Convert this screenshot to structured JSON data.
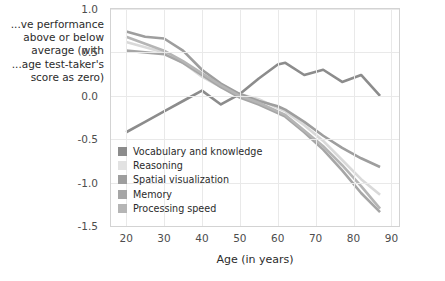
{
  "chart_data": {
    "type": "line",
    "title": "",
    "xlabel": "Age (in years)",
    "ylabel": "...ve performance\nabove or below\naverage (with\n...age test-taker's\nscore as zero)",
    "xlim": [
      16,
      92
    ],
    "ylim": [
      -1.5,
      1.0
    ],
    "xticks": [
      "20",
      "30",
      "40",
      "50",
      "60",
      "70",
      "80",
      "90"
    ],
    "xtick_values": [
      20,
      30,
      40,
      50,
      60,
      70,
      80,
      90
    ],
    "yticks": [
      "1.0",
      "0.5",
      "0.0",
      "-0.5",
      "-1.0",
      "-1.5"
    ],
    "ytick_values": [
      1.0,
      0.5,
      0.0,
      -0.5,
      -1.0,
      -1.5
    ],
    "grid": true,
    "legend_position": "center-left-inside",
    "x": [
      20,
      25,
      30,
      35,
      40,
      45,
      50,
      55,
      60,
      62,
      67,
      72,
      77,
      82,
      87
    ],
    "series": [
      {
        "name": "Vocabulary and knowledge",
        "color": "#8c8c8c",
        "values": [
          -0.42,
          -0.3,
          -0.18,
          -0.06,
          0.06,
          -0.1,
          0.02,
          0.2,
          0.36,
          0.38,
          0.24,
          0.3,
          0.16,
          0.24,
          0.0
        ]
      },
      {
        "name": "Reasoning",
        "color": "#d9d9d9",
        "values": [
          0.62,
          0.56,
          0.5,
          0.38,
          0.22,
          0.1,
          0.02,
          -0.04,
          -0.14,
          -0.18,
          -0.34,
          -0.52,
          -0.74,
          -0.96,
          -1.14
        ]
      },
      {
        "name": "Spatial visualization",
        "color": "#9e9e9e",
        "values": [
          0.74,
          0.68,
          0.66,
          0.52,
          0.3,
          0.14,
          0.02,
          -0.06,
          -0.12,
          -0.16,
          -0.3,
          -0.46,
          -0.6,
          -0.72,
          -0.82
        ]
      },
      {
        "name": "Memory",
        "color": "#a6a6a6",
        "values": [
          0.52,
          0.5,
          0.48,
          0.38,
          0.24,
          0.1,
          -0.02,
          -0.1,
          -0.2,
          -0.24,
          -0.42,
          -0.62,
          -0.86,
          -1.12,
          -1.34
        ]
      },
      {
        "name": "Processing speed",
        "color": "#b5b5b5",
        "values": [
          0.68,
          0.6,
          0.52,
          0.4,
          0.26,
          0.12,
          0.0,
          -0.08,
          -0.18,
          -0.22,
          -0.4,
          -0.58,
          -0.8,
          -1.04,
          -1.3
        ]
      }
    ]
  },
  "legend": {
    "items": [
      {
        "label": "Vocabulary and knowledge",
        "color": "#8c8c8c"
      },
      {
        "label": "Reasoning",
        "color": "#e2e2e2"
      },
      {
        "label": "Spatial visualization",
        "color": "#9e9e9e"
      },
      {
        "label": "Memory",
        "color": "#a6a6a6"
      },
      {
        "label": "Processing speed",
        "color": "#b5b5b5"
      }
    ]
  },
  "colors": {
    "axis": "#d3d3d3",
    "grid": "#e9e9e9",
    "tick_text": "#4d4d4d",
    "label_text": "#2b2b2b",
    "background": "#ffffff"
  }
}
